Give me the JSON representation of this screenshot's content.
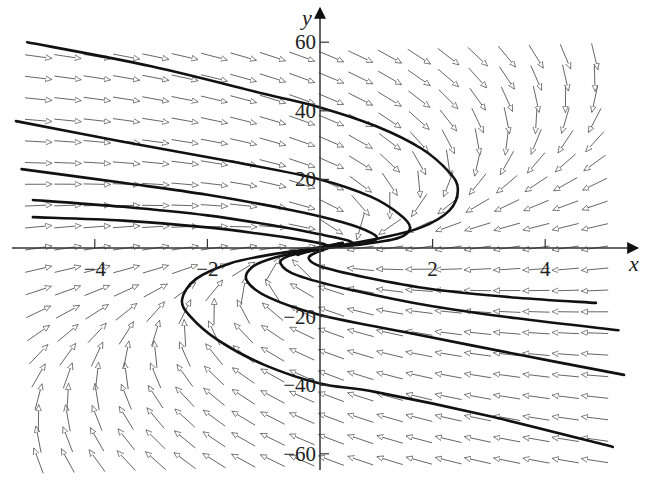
{
  "chart_data": {
    "type": "direction-field-with-trajectories",
    "title": "",
    "xlabel": "x",
    "ylabel": "y",
    "xlim": [
      -5.7,
      5.6
    ],
    "ylim": [
      -68,
      70
    ],
    "grid": false,
    "x_ticks": [
      {
        "value": -4,
        "label": "−4"
      },
      {
        "value": -2,
        "label": "−2"
      },
      {
        "value": 2,
        "label": "2"
      },
      {
        "value": 4,
        "label": "4"
      }
    ],
    "y_ticks": [
      {
        "value": 60,
        "label": "60"
      },
      {
        "value": 40,
        "label": "40"
      },
      {
        "value": 20,
        "label": "20"
      },
      {
        "value": -20,
        "label": "−20"
      },
      {
        "value": -40,
        "label": "−40"
      },
      {
        "value": -60,
        "label": "−60"
      }
    ],
    "field": {
      "description": "dx/dt = -x + y/10, dy/dt = -0.65y - 2.5x (visual approximation)",
      "x_range": [
        -5,
        5.2
      ],
      "x_step": 0.52,
      "y_range": [
        -62,
        60
      ],
      "y_step": 6.2
    },
    "trajectories": [
      {
        "name": "curve-1",
        "points": [
          [
            -5.2,
            60
          ],
          [
            -3,
            53
          ],
          [
            -1,
            45
          ],
          [
            0,
            41
          ],
          [
            1,
            35.5
          ],
          [
            1.8,
            29
          ],
          [
            2.3,
            22
          ],
          [
            2.45,
            17
          ],
          [
            2.3,
            11
          ],
          [
            1.8,
            6
          ],
          [
            1.1,
            3
          ],
          [
            0.3,
            0.6
          ],
          [
            -0.2,
            -1
          ],
          [
            -0.4,
            -2
          ]
        ]
      },
      {
        "name": "curve-2",
        "points": [
          [
            -5.4,
            37
          ],
          [
            -3.5,
            31
          ],
          [
            -1.5,
            25
          ],
          [
            0,
            20
          ],
          [
            0.9,
            15
          ],
          [
            1.4,
            10
          ],
          [
            1.6,
            6
          ],
          [
            1.4,
            3
          ],
          [
            0.8,
            1.2
          ],
          [
            0.2,
            0.2
          ],
          [
            -0.3,
            -1.2
          ],
          [
            -0.5,
            -2
          ]
        ]
      },
      {
        "name": "curve-3",
        "points": [
          [
            -5.3,
            23
          ],
          [
            -3.5,
            19
          ],
          [
            -2,
            15.5
          ],
          [
            -0.5,
            11
          ],
          [
            0.4,
            7.5
          ],
          [
            0.9,
            4.5
          ],
          [
            1,
            2.5
          ],
          [
            0.7,
            1.1
          ],
          [
            0.2,
            0.2
          ],
          [
            -0.4,
            -1.3
          ]
        ]
      },
      {
        "name": "curve-4",
        "points": [
          [
            -5.1,
            14
          ],
          [
            -3.5,
            12
          ],
          [
            -2,
            9.5
          ],
          [
            -0.8,
            6.5
          ],
          [
            0,
            4
          ],
          [
            0.5,
            2.2
          ],
          [
            0.55,
            1
          ],
          [
            0.2,
            0.2
          ],
          [
            -0.4,
            -1.5
          ]
        ]
      },
      {
        "name": "curve-5",
        "points": [
          [
            -5.1,
            9
          ],
          [
            -3.5,
            8
          ],
          [
            -2,
            6
          ],
          [
            -1,
            4
          ],
          [
            -0.3,
            2.3
          ],
          [
            0.1,
            1
          ],
          [
            0.05,
            0.1
          ],
          [
            -0.4,
            -1.5
          ]
        ]
      },
      {
        "name": "curve-6",
        "points": [
          [
            5.2,
            -58
          ],
          [
            3,
            -49
          ],
          [
            1,
            -42
          ],
          [
            0,
            -39.5
          ],
          [
            -1,
            -34
          ],
          [
            -1.8,
            -27
          ],
          [
            -2.3,
            -20
          ],
          [
            -2.45,
            -15
          ],
          [
            -2.2,
            -9
          ],
          [
            -1.6,
            -4.5
          ],
          [
            -0.9,
            -2
          ],
          [
            -0.2,
            -0.3
          ],
          [
            0.4,
            1.5
          ]
        ]
      },
      {
        "name": "curve-7",
        "points": [
          [
            5.4,
            -37
          ],
          [
            3.5,
            -31
          ],
          [
            1.5,
            -24.5
          ],
          [
            0,
            -19.5
          ],
          [
            -0.9,
            -14.5
          ],
          [
            -1.3,
            -9.5
          ],
          [
            -1.2,
            -5.5
          ],
          [
            -0.8,
            -2.8
          ],
          [
            -0.2,
            -0.6
          ],
          [
            0.4,
            1.4
          ]
        ]
      },
      {
        "name": "curve-8",
        "points": [
          [
            5.3,
            -24
          ],
          [
            3.5,
            -20.5
          ],
          [
            2,
            -17
          ],
          [
            0.5,
            -12
          ],
          [
            -0.4,
            -8
          ],
          [
            -0.7,
            -4.5
          ],
          [
            -0.55,
            -2.3
          ],
          [
            -0.1,
            -0.5
          ],
          [
            0.4,
            1.4
          ]
        ]
      },
      {
        "name": "curve-9",
        "points": [
          [
            4.9,
            -16
          ],
          [
            3.5,
            -14.5
          ],
          [
            2,
            -12
          ],
          [
            0.8,
            -8.5
          ],
          [
            0,
            -5.3
          ],
          [
            -0.2,
            -3
          ],
          [
            -0.05,
            -1.2
          ],
          [
            0.4,
            1.4
          ]
        ]
      }
    ]
  }
}
